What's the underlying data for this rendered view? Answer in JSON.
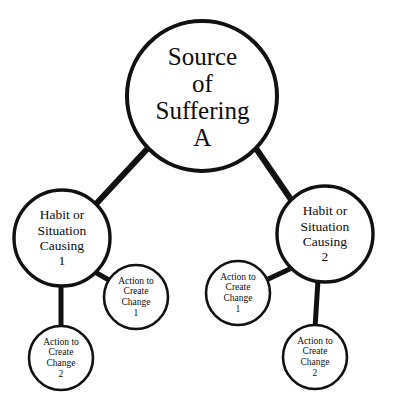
{
  "diagram": {
    "style": {
      "background": "#ffffff",
      "stroke": "#111111",
      "text": "#0d0d0d",
      "node_fill": "#ffffff"
    },
    "nodes": [
      {
        "id": "root",
        "role": "source",
        "lines": [
          "Source",
          "of",
          "Suffering",
          "A"
        ],
        "cx": 202,
        "cy": 96,
        "r": 75,
        "stroke_width": 4
      },
      {
        "id": "habit-1",
        "role": "habit",
        "lines": [
          "Habit or",
          "Situation",
          "Causing",
          "1"
        ],
        "cx": 62,
        "cy": 238,
        "r": 48,
        "stroke_width": 3.4
      },
      {
        "id": "habit-2",
        "role": "habit",
        "lines": [
          "Habit or",
          "Situation",
          "Causing",
          "2"
        ],
        "cx": 325,
        "cy": 234,
        "r": 48,
        "stroke_width": 3.4
      },
      {
        "id": "action-1a",
        "role": "action",
        "lines": [
          "Action to",
          "Create",
          "Change",
          "1"
        ],
        "cx": 136,
        "cy": 297,
        "r": 32,
        "stroke_width": 2.6
      },
      {
        "id": "action-2a",
        "role": "action",
        "lines": [
          "Action to",
          "Create",
          "Change",
          "2"
        ],
        "cx": 61,
        "cy": 358,
        "r": 32,
        "stroke_width": 2.6
      },
      {
        "id": "action-1b",
        "role": "action",
        "lines": [
          "Action to",
          "Create",
          "Change",
          "1"
        ],
        "cx": 238,
        "cy": 293,
        "r": 32,
        "stroke_width": 2.6
      },
      {
        "id": "action-2b",
        "role": "action",
        "lines": [
          "Action to",
          "Create",
          "Change",
          "2"
        ],
        "cx": 315,
        "cy": 357,
        "r": 32,
        "stroke_width": 2.6
      }
    ],
    "edges": [
      {
        "id": "root-to-habit-1",
        "from": "root",
        "to": "habit-1",
        "x1": 148,
        "y1": 148,
        "x2": 96,
        "y2": 204,
        "width": 6
      },
      {
        "id": "root-to-habit-2",
        "from": "root",
        "to": "habit-2",
        "x1": 255,
        "y1": 147,
        "x2": 292,
        "y2": 201,
        "width": 6
      },
      {
        "id": "habit-1-to-action-1a",
        "from": "habit-1",
        "to": "action-1a",
        "x1": 95,
        "y1": 273,
        "x2": 114,
        "y2": 283,
        "width": 5
      },
      {
        "id": "habit-1-to-action-2a",
        "from": "habit-1",
        "to": "action-2a",
        "x1": 61,
        "y1": 285,
        "x2": 61,
        "y2": 327,
        "width": 5
      },
      {
        "id": "habit-2-to-action-1b",
        "from": "habit-2",
        "to": "action-1b",
        "x1": 292,
        "y1": 268,
        "x2": 266,
        "y2": 280,
        "width": 5
      },
      {
        "id": "habit-2-to-action-2b",
        "from": "habit-2",
        "to": "action-2b",
        "x1": 318,
        "y1": 281,
        "x2": 315,
        "y2": 326,
        "width": 5
      }
    ]
  },
  "root_text": {
    "line1": "Source",
    "line2": "of",
    "line3": "Suffering",
    "line4": "A"
  },
  "habit_1_text": {
    "line1": "Habit or",
    "line2": "Situation",
    "line3": "Causing",
    "line4": "1"
  },
  "habit_2_text": {
    "line1": "Habit or",
    "line2": "Situation",
    "line3": "Causing",
    "line4": "2"
  },
  "action_1a_text": {
    "line1": "Action to",
    "line2": "Create",
    "line3": "Change",
    "line4": "1"
  },
  "action_2a_text": {
    "line1": "Action to",
    "line2": "Create",
    "line3": "Change",
    "line4": "2"
  },
  "action_1b_text": {
    "line1": "Action to",
    "line2": "Create",
    "line3": "Change",
    "line4": "1"
  },
  "action_2b_text": {
    "line1": "Action to",
    "line2": "Create",
    "line3": "Change",
    "line4": "2"
  }
}
